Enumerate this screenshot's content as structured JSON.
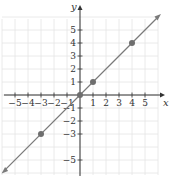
{
  "chart_data": {
    "type": "line",
    "title": "",
    "xlabel": "x",
    "ylabel": "y",
    "xlim": [
      -6,
      6
    ],
    "ylim": [
      -6,
      6
    ],
    "grid": true,
    "x_ticks": [
      -5,
      -4,
      -3,
      -2,
      -1,
      1,
      2,
      3,
      4,
      5
    ],
    "y_ticks": [
      -5,
      -3,
      -2,
      -1,
      1,
      2,
      3,
      4,
      5
    ],
    "x_tick_labels": [
      "−5",
      "−4",
      "−3",
      "−2",
      "−1",
      "1",
      "2",
      "3",
      "4",
      "5"
    ],
    "y_tick_labels": [
      "−5",
      "−3",
      "−2",
      "−1",
      "1",
      "2",
      "3",
      "4",
      "5"
    ],
    "series": [
      {
        "name": "y = x",
        "line": {
          "slope": 1,
          "intercept": 0,
          "arrows": "both"
        },
        "points": [
          {
            "x": -3,
            "y": -3
          },
          {
            "x": 0,
            "y": 0
          },
          {
            "x": 1,
            "y": 1
          },
          {
            "x": 4,
            "y": 4
          }
        ]
      }
    ],
    "colors": {
      "line": "#7a7a7a",
      "points": "#6e6e6e",
      "axis": "#333333",
      "grid": "#e4e4e4"
    }
  }
}
